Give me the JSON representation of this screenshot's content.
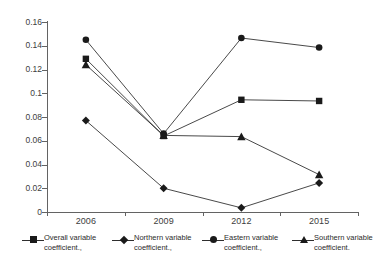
{
  "chart_data": {
    "type": "line",
    "title": "",
    "xlabel": "",
    "ylabel": "",
    "categories": [
      "2006",
      "2009",
      "2012",
      "2015"
    ],
    "ylim": [
      0,
      0.16
    ],
    "yticks": [
      0,
      0.02,
      0.04,
      0.06,
      0.08,
      0.1,
      0.12,
      0.14,
      0.16
    ],
    "ytick_labels": [
      "0",
      "0.02",
      "0.04",
      "0.06",
      "0.08",
      "0.1",
      "0.12",
      "0.14",
      "0.16"
    ],
    "grid": false,
    "legend_position": "bottom",
    "series": [
      {
        "name": "Overall variable coefficient.,",
        "marker": "square",
        "color": "#1a1a1a",
        "values": [
          0.129,
          0.064,
          0.0945,
          0.0935
        ]
      },
      {
        "name": "Northern variable coefficient.,",
        "marker": "diamond",
        "color": "#1a1a1a",
        "values": [
          0.077,
          0.02,
          0.0035,
          0.0245
        ]
      },
      {
        "name": "Eastern variable coefficient.,",
        "marker": "circle",
        "color": "#1a1a1a",
        "values": [
          0.145,
          0.066,
          0.1465,
          0.1385
        ]
      },
      {
        "name": "Southern variable coefficient.",
        "marker": "triangle",
        "color": "#1a1a1a",
        "values": [
          0.124,
          0.0645,
          0.0635,
          0.0315
        ]
      }
    ]
  },
  "legend": {
    "items": [
      {
        "label_line1": "Overall variable",
        "label_line2": "coefficient.,"
      },
      {
        "label_line1": "Northern variable",
        "label_line2": "coefficient.,"
      },
      {
        "label_line1": "Eastern variable",
        "label_line2": "coefficient.,"
      },
      {
        "label_line1": "Southern variable",
        "label_line2": "coefficient."
      }
    ]
  },
  "axes": {
    "y_labels": [
      "0.16",
      "0.14",
      "0.12",
      "0.1",
      "0.08",
      "0.06",
      "0.04",
      "0.02",
      "0"
    ],
    "x_labels": [
      "2006",
      "2009",
      "2012",
      "2015"
    ]
  }
}
